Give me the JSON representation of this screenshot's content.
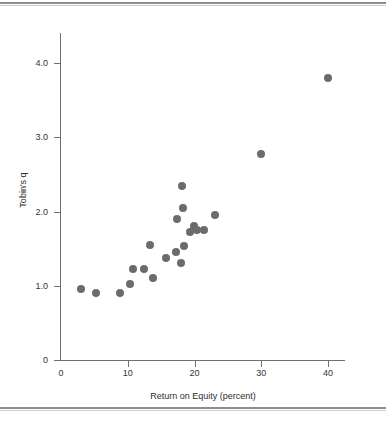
{
  "figure": {
    "background": "#ffffff",
    "point_color": "#6b6b6b",
    "axis_color": "#6f6f6f",
    "rule_color": "#8d8d8d",
    "clipped_caption": ""
  },
  "chart_data": {
    "type": "scatter",
    "title": "",
    "xlabel": "Return on Equity (percent)",
    "ylabel": "Tobin's q",
    "xlim": [
      0,
      42.5
    ],
    "ylim": [
      0,
      4.25
    ],
    "xticks": [
      0,
      10,
      20,
      30,
      40
    ],
    "xticklabels": [
      "0",
      "10",
      "20",
      "30",
      "40"
    ],
    "yticks": [
      0,
      1.0,
      2.0,
      3.0,
      4.0
    ],
    "yticklabels": [
      "0",
      "1.0",
      "2.0",
      "3.0",
      "4.0"
    ],
    "grid": false,
    "legend": null,
    "marker": "circle",
    "points": [
      {
        "x": 3.0,
        "y": 0.95
      },
      {
        "x": 5.2,
        "y": 0.9
      },
      {
        "x": 8.8,
        "y": 0.9
      },
      {
        "x": 10.4,
        "y": 1.03
      },
      {
        "x": 10.8,
        "y": 1.22
      },
      {
        "x": 12.4,
        "y": 1.22
      },
      {
        "x": 13.4,
        "y": 1.55
      },
      {
        "x": 13.8,
        "y": 1.1
      },
      {
        "x": 15.8,
        "y": 1.37
      },
      {
        "x": 17.2,
        "y": 1.45
      },
      {
        "x": 18.1,
        "y": 2.35
      },
      {
        "x": 18.3,
        "y": 2.05
      },
      {
        "x": 17.4,
        "y": 1.9
      },
      {
        "x": 18.0,
        "y": 1.3
      },
      {
        "x": 18.4,
        "y": 1.53
      },
      {
        "x": 19.4,
        "y": 1.72
      },
      {
        "x": 19.9,
        "y": 1.8
      },
      {
        "x": 20.4,
        "y": 1.75
      },
      {
        "x": 21.4,
        "y": 1.75
      },
      {
        "x": 23.0,
        "y": 1.95
      },
      {
        "x": 30.0,
        "y": 2.78
      },
      {
        "x": 40.0,
        "y": 3.8
      }
    ]
  }
}
